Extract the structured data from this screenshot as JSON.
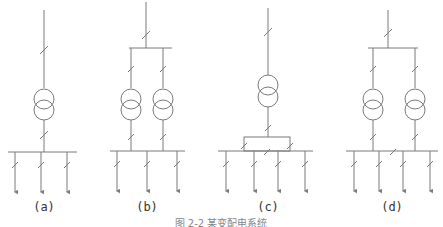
{
  "figure": {
    "caption": "图 2-2 某变配电系统",
    "line_color": "#7a7a7a",
    "panels": [
      {
        "id": "a",
        "label": "(a)",
        "transformers": 1,
        "incoming_buses": 0,
        "feeders": 3,
        "bus_tie": false
      },
      {
        "id": "b",
        "label": "(b)",
        "transformers": 2,
        "incoming_buses": 1,
        "feeders": 3,
        "bus_tie": false
      },
      {
        "id": "c",
        "label": "(c)",
        "transformers": 1,
        "incoming_buses": 0,
        "feeders": 4,
        "bus_tie": true
      },
      {
        "id": "d",
        "label": "(d)",
        "transformers": 2,
        "incoming_buses": 1,
        "feeders": 4,
        "bus_tie": true
      }
    ]
  }
}
